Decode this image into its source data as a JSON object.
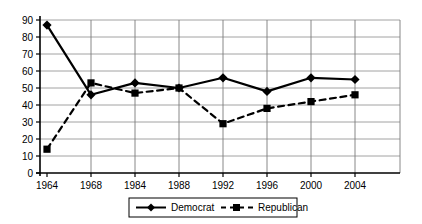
{
  "chart_data": {
    "type": "line",
    "title": "",
    "subtitle": "",
    "xlabel": "",
    "ylabel": "",
    "categories": [
      "1964",
      "1968",
      "1984",
      "1988",
      "1992",
      "1996",
      "2000",
      "2004"
    ],
    "series": [
      {
        "name": "Democrat",
        "style": "solid",
        "marker": "diamond",
        "color": "#000000",
        "values": [
          87,
          46,
          53,
          50,
          56,
          48,
          56,
          55
        ]
      },
      {
        "name": "Republican",
        "style": "dashed",
        "marker": "square",
        "color": "#000000",
        "values": [
          14,
          53,
          47,
          50,
          29,
          38,
          42,
          46
        ]
      }
    ],
    "ylim": [
      0,
      90
    ],
    "yticks": [
      "0",
      "10",
      "20",
      "30",
      "40",
      "50",
      "60",
      "70",
      "80",
      "90"
    ],
    "grid": true,
    "legend_position": "bottom"
  },
  "legend": {
    "democrat_label": "Democrat",
    "republican_label": "Republican"
  },
  "axes": {
    "y_labels": [
      "90",
      "80",
      "70",
      "60",
      "50",
      "40",
      "30",
      "20",
      "10",
      "0"
    ],
    "x_labels": [
      "1964",
      "1968",
      "1984",
      "1988",
      "1992",
      "1996",
      "2000",
      "2004"
    ]
  }
}
